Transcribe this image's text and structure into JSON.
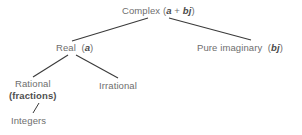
{
  "diagram": {
    "text_color": "#6e6e6e",
    "variable_color": "#4a4a4a",
    "line_color": "#3a3a3a",
    "background": "#ffffff",
    "nodes": {
      "complex": {
        "label": "Complex",
        "expr_open": "(",
        "var_a": "a",
        "operator": "+",
        "var_bj": "bj",
        "expr_close": ")"
      },
      "real": {
        "label": "Real",
        "expr_open": "(",
        "var_a": "a",
        "expr_close": ")"
      },
      "pure_imaginary": {
        "label": "Pure imaginary",
        "expr_open": "(",
        "var_bj": "bj",
        "expr_close": ")"
      },
      "rational": {
        "label": "Rational",
        "sublabel": "(fractions)"
      },
      "irrational": {
        "label": "Irrational"
      },
      "integers": {
        "label": "Integers"
      }
    },
    "edges": [
      {
        "name": "complex-to-real",
        "x1": 148,
        "y1": 18,
        "x2": 72,
        "y2": 41
      },
      {
        "name": "complex-to-pure-imaginary",
        "x1": 169,
        "y1": 18,
        "x2": 251,
        "y2": 40
      },
      {
        "name": "real-to-rational",
        "x1": 68,
        "y1": 55,
        "x2": 33,
        "y2": 77
      },
      {
        "name": "real-to-irrational",
        "x1": 76,
        "y1": 55,
        "x2": 118,
        "y2": 78
      },
      {
        "name": "rational-to-integers",
        "x1": 39,
        "y1": 103,
        "x2": 33,
        "y2": 113
      }
    ]
  }
}
